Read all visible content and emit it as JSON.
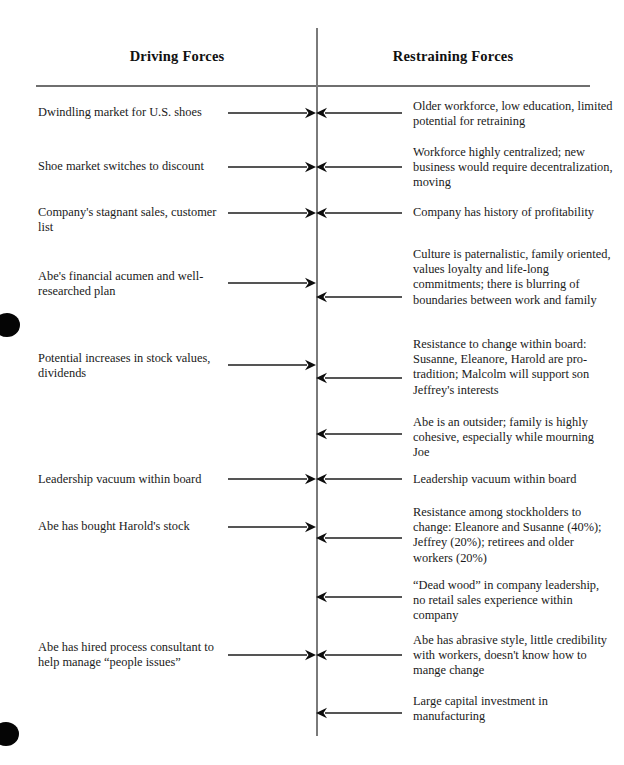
{
  "diagram": {
    "type": "force-field-analysis",
    "headers": {
      "left": "Driving Forces",
      "right": "Restraining Forces"
    },
    "axis": {
      "x": 316,
      "top": 28,
      "bottom": 736,
      "color": "#7a7a7a"
    },
    "rule": {
      "x": 36,
      "y": 85,
      "width": 554,
      "color": "#6f6f6f"
    },
    "layout": {
      "left_text_x": 38,
      "left_text_width": 190,
      "right_text_x": 413,
      "right_text_width": 200,
      "left_arrow_start": 228,
      "left_arrow_end": 316,
      "right_arrow_start": 402,
      "right_arrow_end": 316
    },
    "rows": [
      {
        "id": "row-1",
        "driving": "Dwindling market for U.S. shoes",
        "restraining": "Older workforce, low education, limited potential for retraining",
        "driving_text_y": 105,
        "restraining_text_y": 99,
        "left_arrow_y": 113,
        "right_arrow_y": 113,
        "has_left_arrow": true,
        "has_right_arrow": true
      },
      {
        "id": "row-2",
        "driving": "Shoe market switches to discount",
        "restraining": "Workforce highly centralized; new business would require decentralization, moving",
        "driving_text_y": 159,
        "restraining_text_y": 145,
        "left_arrow_y": 167,
        "right_arrow_y": 167,
        "has_left_arrow": true,
        "has_right_arrow": true
      },
      {
        "id": "row-3",
        "driving": "Company's stagnant sales, customer list",
        "restraining": "Company has history of profitability",
        "driving_text_y": 205,
        "restraining_text_y": 205,
        "left_arrow_y": 213,
        "right_arrow_y": 213,
        "has_left_arrow": true,
        "has_right_arrow": true
      },
      {
        "id": "row-4",
        "driving": "Abe's financial acumen and well-researched plan",
        "restraining": "Culture is paternalistic, family oriented, values loyalty and life-long commitments; there is blurring of boundaries between work and family",
        "driving_text_y": 269,
        "restraining_text_y": 247,
        "left_arrow_y": 283,
        "right_arrow_y": 297,
        "has_left_arrow": true,
        "has_right_arrow": true
      },
      {
        "id": "row-5",
        "driving": "Potential increases in stock values, dividends",
        "restraining": "Resistance to change within board: Susanne, Eleanore, Harold are pro-tradition; Malcolm will support son Jeffrey's interests",
        "driving_text_y": 351,
        "restraining_text_y": 337,
        "left_arrow_y": 365,
        "right_arrow_y": 378,
        "has_left_arrow": true,
        "has_right_arrow": true
      },
      {
        "id": "row-6",
        "driving": "",
        "restraining": "Abe is an outsider; family is highly cohesive, especially while mourning Joe",
        "driving_text_y": 0,
        "restraining_text_y": 415,
        "left_arrow_y": 0,
        "right_arrow_y": 434,
        "has_left_arrow": false,
        "has_right_arrow": true
      },
      {
        "id": "row-7",
        "driving": "Leadership vacuum within board",
        "restraining": "Leadership vacuum within board",
        "driving_text_y": 472,
        "restraining_text_y": 472,
        "left_arrow_y": 479,
        "right_arrow_y": 479,
        "has_left_arrow": true,
        "has_right_arrow": true
      },
      {
        "id": "row-8",
        "driving": "Abe has bought Harold's stock",
        "restraining": "Resistance among stockholders to change: Eleanore and Susanne (40%); Jeffrey (20%); retirees and older workers (20%)",
        "driving_text_y": 519,
        "restraining_text_y": 505,
        "left_arrow_y": 527,
        "right_arrow_y": 538,
        "has_left_arrow": true,
        "has_right_arrow": true
      },
      {
        "id": "row-9",
        "driving": "",
        "restraining": "“Dead wood” in company leadership, no retail sales experience within company",
        "driving_text_y": 0,
        "restraining_text_y": 578,
        "left_arrow_y": 0,
        "right_arrow_y": 597,
        "has_left_arrow": false,
        "has_right_arrow": true
      },
      {
        "id": "row-10",
        "driving": "Abe has hired process consultant to help manage “people issues”",
        "restraining": "Abe has abrasive style, little credibility with workers, doesn't know how to mange change",
        "driving_text_y": 640,
        "restraining_text_y": 633,
        "left_arrow_y": 655,
        "right_arrow_y": 655,
        "has_left_arrow": true,
        "has_right_arrow": true
      },
      {
        "id": "row-11",
        "driving": "",
        "restraining": "Large capital investment in manufacturing",
        "driving_text_y": 0,
        "restraining_text_y": 694,
        "left_arrow_y": 0,
        "right_arrow_y": 713,
        "has_left_arrow": false,
        "has_right_arrow": true
      }
    ],
    "artifacts": [
      {
        "id": "blob-top",
        "x": -6,
        "y": 313,
        "w": 26,
        "h": 24
      },
      {
        "id": "blob-bottom",
        "x": -7,
        "y": 722,
        "w": 26,
        "h": 24
      }
    ]
  }
}
